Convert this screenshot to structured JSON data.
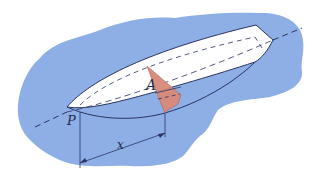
{
  "figure": {
    "labels": {
      "area": "A",
      "point": "P",
      "distance": "x"
    },
    "colors": {
      "water": "#8eaee6",
      "hull": "#ffffff",
      "cross_section": "#d98a78",
      "outline": "#2a3560",
      "axis": "#2a3560"
    }
  }
}
